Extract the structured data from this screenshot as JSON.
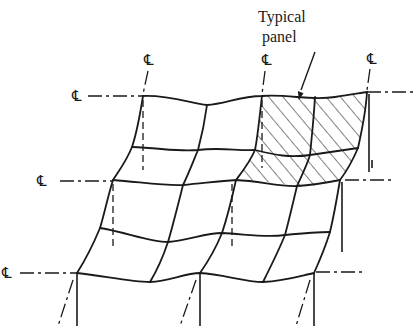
{
  "figure": {
    "annotation": {
      "line1": "Typical",
      "line2": "panel"
    },
    "centerline_symbol": "℄",
    "centerline_labels": [
      {
        "id": "cl-left-top",
        "text": "℄"
      },
      {
        "id": "cl-col-1",
        "text": "℄"
      },
      {
        "id": "cl-col-3",
        "text": "℄"
      },
      {
        "id": "cl-col-5",
        "text": "℄"
      },
      {
        "id": "cl-left-mid",
        "text": "℄"
      },
      {
        "id": "cl-left-bottom",
        "text": "℄"
      }
    ],
    "colors": {
      "ink": "#1a1a1a",
      "background": "#ffffff"
    }
  }
}
